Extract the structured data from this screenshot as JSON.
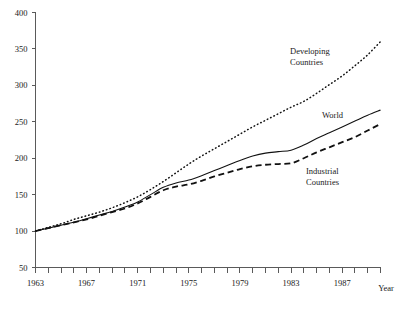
{
  "chart_data": {
    "type": "line",
    "title": "",
    "subtitle": "",
    "xlabel": "Year",
    "ylabel": "",
    "xlim": [
      1963,
      1990
    ],
    "ylim": [
      50,
      400
    ],
    "grid": false,
    "legend_position": "inline-annotations",
    "y_ticks": [
      50,
      100,
      150,
      200,
      250,
      300,
      350,
      400
    ],
    "x_ticks": [
      1963,
      1964,
      1965,
      1966,
      1967,
      1968,
      1969,
      1970,
      1971,
      1972,
      1973,
      1974,
      1975,
      1976,
      1977,
      1978,
      1979,
      1980,
      1981,
      1982,
      1983,
      1984,
      1985,
      1986,
      1987,
      1988,
      1989,
      1990
    ],
    "x_tick_labels": [
      {
        "value": 1963,
        "label": "1963"
      },
      {
        "value": 1967,
        "label": "1967"
      },
      {
        "value": 1971,
        "label": "1971"
      },
      {
        "value": 1975,
        "label": "1975"
      },
      {
        "value": 1979,
        "label": "1979"
      },
      {
        "value": 1983,
        "label": "1983"
      },
      {
        "value": 1987,
        "label": "1987"
      }
    ],
    "x": [
      1963,
      1964,
      1965,
      1966,
      1967,
      1968,
      1969,
      1970,
      1971,
      1972,
      1973,
      1974,
      1975,
      1976,
      1977,
      1978,
      1979,
      1980,
      1981,
      1982,
      1983,
      1984,
      1985,
      1986,
      1987,
      1988,
      1989,
      1990
    ],
    "series": [
      {
        "name": "Developing Countries",
        "style": "dotted",
        "values": [
          100,
          105,
          110,
          116,
          121,
          126,
          132,
          139,
          147,
          157,
          168,
          180,
          192,
          203,
          213,
          223,
          233,
          243,
          252,
          261,
          270,
          278,
          289,
          301,
          313,
          327,
          342,
          360
        ]
      },
      {
        "name": "World",
        "style": "solid",
        "values": [
          100,
          104,
          108,
          112,
          117,
          122,
          127,
          133,
          140,
          150,
          160,
          166,
          170,
          176,
          183,
          190,
          197,
          203,
          207,
          209,
          211,
          218,
          227,
          235,
          243,
          251,
          259,
          266
        ]
      },
      {
        "name": "Industrial Countries",
        "style": "dashed",
        "values": [
          100,
          104,
          108,
          112,
          116,
          121,
          126,
          131,
          138,
          147,
          156,
          161,
          164,
          169,
          175,
          180,
          185,
          189,
          191,
          192,
          193,
          200,
          208,
          215,
          222,
          229,
          238,
          247
        ]
      }
    ],
    "annotations": [
      {
        "name": "developing-countries-label",
        "lines": [
          "Developing",
          "Countries"
        ],
        "x": 290,
        "y": 54
      },
      {
        "name": "world-label",
        "lines": [
          "World"
        ],
        "x": 322,
        "y": 118
      },
      {
        "name": "industrial-countries-label",
        "lines": [
          "Industrial",
          "Countries"
        ],
        "x": 306,
        "y": 174
      }
    ],
    "axis_title_x": {
      "label": "Year",
      "x": 386,
      "y": 291
    },
    "colors": {
      "axis": "#5a5a5a",
      "series": "#111111",
      "text": "#1a1a1a",
      "background": "#ffffff"
    }
  }
}
